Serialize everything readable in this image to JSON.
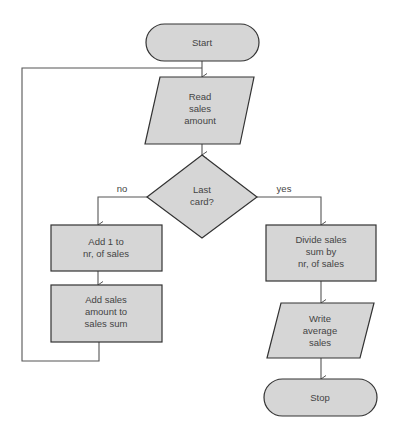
{
  "diagram": {
    "type": "flowchart",
    "colors": {
      "fill": "#d6d6d6",
      "stroke": "#333333",
      "line": "#555555",
      "text": "#444444"
    },
    "nodes": {
      "start": {
        "shape": "terminator",
        "lines": [
          "Start"
        ]
      },
      "read": {
        "shape": "input-output",
        "lines": [
          "Read",
          "sales",
          "amount"
        ]
      },
      "decision": {
        "shape": "decision",
        "lines": [
          "Last",
          "card?"
        ]
      },
      "add1": {
        "shape": "process",
        "lines": [
          "Add 1 to",
          "nr, of sales"
        ]
      },
      "addsum": {
        "shape": "process",
        "lines": [
          "Add sales",
          "amount to",
          "sales sum"
        ]
      },
      "divide": {
        "shape": "process",
        "lines": [
          "Divide sales",
          "sum by",
          "nr, of sales"
        ]
      },
      "write": {
        "shape": "input-output",
        "lines": [
          "Write",
          "average",
          "sales"
        ]
      },
      "stop": {
        "shape": "terminator",
        "lines": [
          "Stop"
        ]
      }
    },
    "edges": {
      "no_label": "no",
      "yes_label": "yes"
    }
  }
}
